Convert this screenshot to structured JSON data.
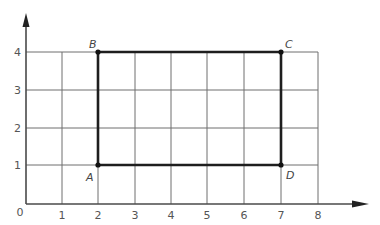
{
  "diagram": {
    "type": "coordinate-grid-rectangle",
    "x_axis": {
      "ticks": [
        "1",
        "2",
        "3",
        "4",
        "5",
        "6",
        "7",
        "8"
      ],
      "min": 0,
      "max": 8
    },
    "y_axis": {
      "ticks": [
        "1",
        "2",
        "3",
        "4"
      ],
      "min": 0,
      "max": 4
    },
    "origin_label": "0",
    "points": [
      {
        "label": "A",
        "x": 2,
        "y": 1
      },
      {
        "label": "B",
        "x": 2,
        "y": 4
      },
      {
        "label": "C",
        "x": 7,
        "y": 4
      },
      {
        "label": "D",
        "x": 7,
        "y": 1
      }
    ],
    "colors": {
      "grid": "#6e6e6e",
      "axis": "#4a4a4a",
      "rectangle": "#1e1e1e",
      "text": "#555555"
    }
  }
}
